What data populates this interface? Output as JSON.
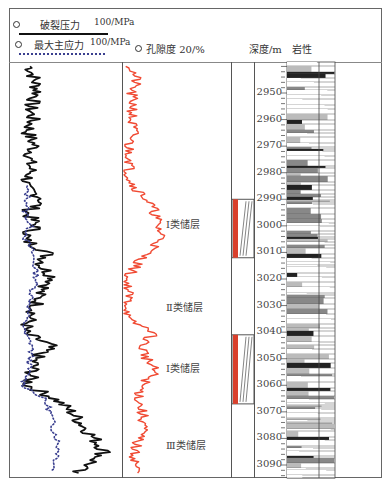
{
  "header": {
    "legend_frac": {
      "label": "破裂压力",
      "scale": "100/MPa",
      "line_color": "#111111",
      "line_style": "solid"
    },
    "legend_stress": {
      "label": "最大主应力",
      "scale": "100/MPa",
      "line_color": "#3a3f8f",
      "line_style": "dotted"
    },
    "legend_porosity": {
      "label": "孔隙度 20/%",
      "line_color": "#f04a33"
    },
    "depth_header": "深度/m",
    "lith_header": "岩性"
  },
  "depth_ticks": [
    "2950",
    "2960",
    "2970",
    "2980",
    "2990",
    "3000",
    "3010",
    "3020",
    "3030",
    "3040",
    "3050",
    "3060",
    "3070",
    "3080",
    "3090"
  ],
  "reservoir_labels": [
    {
      "label": "Ⅰ类储层",
      "depth": 2999
    },
    {
      "label": "Ⅱ类储层",
      "depth": 3030
    },
    {
      "label": "Ⅰ类储层",
      "depth": 3053
    },
    {
      "label": "Ⅲ类储层",
      "depth": 3082
    }
  ],
  "colors": {
    "frac": "#111111",
    "stress": "#3a3f8f",
    "porosity": "#f04a33",
    "reservoir_bar": "#d9402c"
  },
  "chart_data": {
    "type": "line",
    "title": "",
    "xlabel": "",
    "ylabel": "深度/m",
    "ylim": [
      2938,
      3095
    ],
    "y_axis_inverted": true,
    "tracks": [
      {
        "name": "pressure",
        "scale_max": 100,
        "unit": "MPa",
        "series": [
          {
            "name": "破裂压力",
            "style": "solid",
            "depth": [
              2940,
              2945,
              2950,
              2955,
              2960,
              2965,
              2970,
              2975,
              2980,
              2985,
              2990,
              2995,
              3000,
              3005,
              3010,
              3015,
              3020,
              3025,
              3030,
              3035,
              3040,
              3045,
              3050,
              3055,
              3060,
              3065,
              3070,
              3075,
              3080,
              3085,
              3090,
              3093
            ],
            "values": [
              18,
              22,
              25,
              18,
              20,
              16,
              22,
              17,
              19,
              12,
              30,
              15,
              24,
              12,
              34,
              28,
              40,
              26,
              24,
              18,
              12,
              36,
              22,
              20,
              16,
              40,
              55,
              65,
              75,
              85,
              70,
              55
            ]
          },
          {
            "name": "最大主应力",
            "style": "dotted",
            "depth": [
              2985,
              2990,
              2995,
              3000,
              3005,
              3010,
              3015,
              3020,
              3025,
              3030,
              3035,
              3040,
              3045,
              3050,
              3055,
              3060,
              3065,
              3070,
              3075,
              3080,
              3085,
              3090,
              3093
            ],
            "values": [
              14,
              16,
              14,
              18,
              14,
              20,
              22,
              24,
              20,
              18,
              14,
              12,
              20,
              18,
              16,
              12,
              30,
              36,
              38,
              42,
              44,
              40,
              38
            ]
          }
        ]
      },
      {
        "name": "porosity",
        "scale_max": 20,
        "unit": "%",
        "series": [
          {
            "name": "孔隙度",
            "depth": [
              2940,
              2945,
              2950,
              2955,
              2960,
              2965,
              2970,
              2975,
              2980,
              2985,
              2990,
              2995,
              3000,
              3005,
              3010,
              3015,
              3020,
              3025,
              3030,
              3035,
              3040,
              3045,
              3050,
              3055,
              3060,
              3065,
              3070,
              3075,
              3080,
              3085,
              3090,
              3093
            ],
            "values": [
              1.5,
              2.5,
              1.5,
              2.0,
              1.5,
              2.0,
              1.0,
              1.5,
              1.0,
              2.0,
              4.5,
              6.0,
              6.5,
              7.5,
              4.5,
              2.5,
              0.5,
              1.0,
              1.0,
              0.5,
              6.0,
              3.5,
              4.5,
              6.0,
              3.5,
              3.0,
              3.5,
              4.0,
              3.0,
              2.0,
              2.5,
              2.5
            ]
          }
        ]
      }
    ],
    "reservoir_intervals": [
      {
        "top": 2990,
        "bottom": 3012
      },
      {
        "top": 3041,
        "bottom": 3067
      }
    ]
  }
}
